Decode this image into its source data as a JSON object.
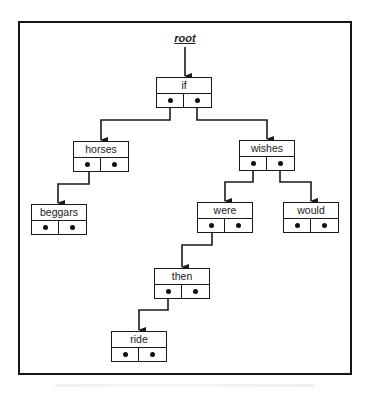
{
  "diagram": {
    "type": "binary-search-tree",
    "root_pointer_label": "root",
    "nodes": [
      {
        "id": "if",
        "label": "if",
        "left_child": "horses",
        "right_child": "wishes"
      },
      {
        "id": "horses",
        "label": "horses",
        "left_child": "beggars",
        "right_child": null
      },
      {
        "id": "wishes",
        "label": "wishes",
        "left_child": "were",
        "right_child": "would"
      },
      {
        "id": "beggars",
        "label": "beggars",
        "left_child": null,
        "right_child": null
      },
      {
        "id": "were",
        "label": "were",
        "left_child": "then",
        "right_child": null
      },
      {
        "id": "would",
        "label": "would",
        "left_child": null,
        "right_child": null
      },
      {
        "id": "then",
        "label": "then",
        "left_child": "ride",
        "right_child": null
      },
      {
        "id": "ride",
        "label": "ride",
        "left_child": null,
        "right_child": null
      }
    ],
    "edges": [
      {
        "from": "root",
        "to": "if"
      },
      {
        "from": "if",
        "side": "left",
        "to": "horses"
      },
      {
        "from": "if",
        "side": "right",
        "to": "wishes"
      },
      {
        "from": "horses",
        "side": "left",
        "to": "beggars"
      },
      {
        "from": "wishes",
        "side": "left",
        "to": "were"
      },
      {
        "from": "wishes",
        "side": "right",
        "to": "would"
      },
      {
        "from": "were",
        "side": "left",
        "to": "then"
      },
      {
        "from": "then",
        "side": "left",
        "to": "ride"
      }
    ],
    "colors": {
      "line": "#1a1a1a",
      "background": "#ffffff"
    }
  }
}
